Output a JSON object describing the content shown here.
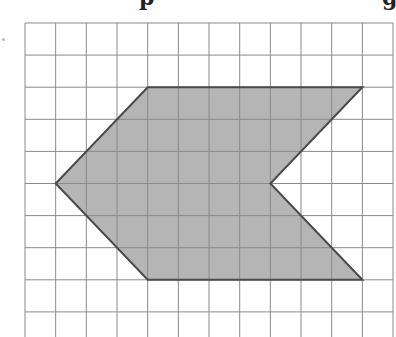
{
  "title_fragments": [
    "p",
    "g"
  ],
  "grid": {
    "x0": 25,
    "y0": 23,
    "cell_w": 30.67,
    "cell_h": 32.1,
    "cols": 12,
    "rows": 10,
    "line_color": "#8a8a8a"
  },
  "shape": {
    "name": "arrow-hexagon",
    "fill": "#b5b5b5",
    "stroke": "#4a4a4a",
    "vertices_grid": [
      [
        4,
        2
      ],
      [
        11,
        2
      ],
      [
        8,
        5
      ],
      [
        11,
        8
      ],
      [
        4,
        8
      ],
      [
        1,
        5
      ]
    ]
  }
}
